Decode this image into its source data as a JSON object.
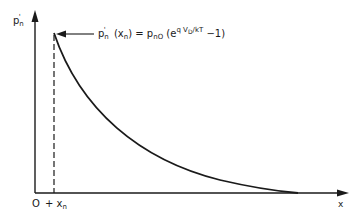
{
  "diagram": {
    "y_axis_label": {
      "base": "p",
      "prime": "'",
      "sub": "n"
    },
    "x_axis_label": "x",
    "origin_label": "O",
    "boundary_label": {
      "prefix": "+",
      "base": "x",
      "sub": "n"
    },
    "equation": {
      "lhs_base": "p",
      "lhs_prime": "'",
      "lhs_sub": "n",
      "lhs_arg": "(x",
      "lhs_arg_sub": "n",
      "lhs_close": ")",
      "equals": "=",
      "rhs_base": "p",
      "rhs_sub": "nO",
      "open": "(e",
      "exp_q": "q",
      "exp_v": "V",
      "exp_v_sub": "D",
      "exp_rest": "/kT",
      "tail": "−1)"
    },
    "curve": "exponential decay",
    "colors": {
      "ink": "#1a1a1a",
      "background": "#ffffff"
    }
  }
}
